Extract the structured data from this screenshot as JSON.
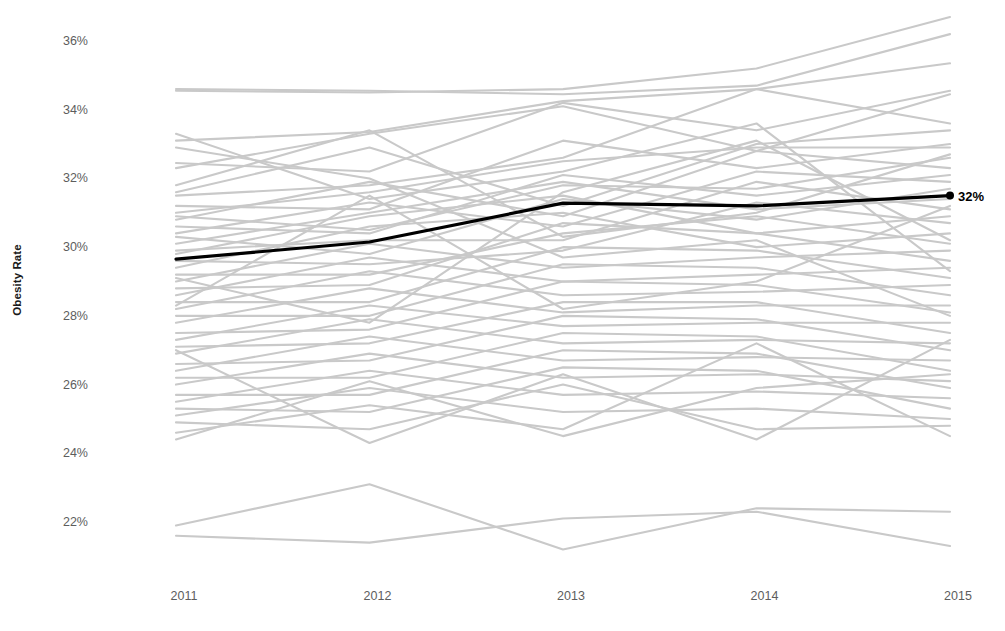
{
  "chart_data": {
    "type": "line",
    "title": "",
    "subtitle": "",
    "xlabel": "",
    "ylabel": "Obesity Rate",
    "x": [
      2011,
      2012,
      2013,
      2014,
      2015
    ],
    "xtick_labels": [
      "2011",
      "2012",
      "2013",
      "2014",
      "2015"
    ],
    "ytick_labels": [
      "36%",
      "34%",
      "32%",
      "30%",
      "28%",
      "26%",
      "24%",
      "22%"
    ],
    "ytick_values": [
      36,
      34,
      32,
      30,
      28,
      26,
      24,
      22
    ],
    "ylim": [
      21.2,
      37.0
    ],
    "xlim": [
      2011,
      2015
    ],
    "grid": false,
    "legend": "none",
    "axis_line": "none",
    "annotations": [
      {
        "text": "32%",
        "x": 2015,
        "y": 31.5,
        "marker": "dot",
        "color": "#000000"
      }
    ],
    "highlight_color": "#000000",
    "background_series_color": "#c9c9c9",
    "tick_label_color": "#5d5d5d",
    "highlight_series": {
      "name": "National Average",
      "color": "#000000",
      "width": 3.2,
      "values": [
        29.65,
        30.15,
        31.28,
        31.2,
        31.5
      ]
    },
    "series": [
      {
        "name": "s01",
        "values": [
          34.55,
          34.5,
          34.6,
          35.2,
          36.7
        ]
      },
      {
        "name": "s02",
        "values": [
          34.6,
          34.55,
          34.45,
          34.7,
          36.2
        ]
      },
      {
        "name": "s03",
        "values": [
          33.1,
          33.35,
          34.25,
          34.6,
          35.35
        ]
      },
      {
        "name": "s04",
        "values": [
          32.45,
          32.2,
          34.2,
          33.4,
          34.55
        ]
      },
      {
        "name": "s05",
        "values": [
          32.3,
          33.3,
          34.1,
          32.8,
          34.45
        ]
      },
      {
        "name": "s06",
        "values": [
          31.5,
          31.8,
          32.6,
          34.6,
          33.6
        ]
      },
      {
        "name": "s07",
        "values": [
          31.6,
          32.9,
          31.2,
          33.0,
          33.4
        ]
      },
      {
        "name": "s08",
        "values": [
          31.2,
          31.1,
          33.1,
          32.3,
          33.0
        ]
      },
      {
        "name": "s09",
        "values": [
          31.0,
          31.6,
          32.5,
          32.9,
          32.9
        ]
      },
      {
        "name": "s10",
        "values": [
          30.9,
          30.5,
          31.8,
          31.7,
          32.6
        ]
      },
      {
        "name": "s11",
        "values": [
          30.8,
          31.9,
          30.9,
          32.8,
          32.3
        ]
      },
      {
        "name": "s12",
        "values": [
          30.6,
          30.4,
          32.1,
          31.5,
          32.1
        ]
      },
      {
        "name": "s13",
        "values": [
          30.4,
          31.3,
          30.6,
          32.2,
          31.9
        ]
      },
      {
        "name": "s14",
        "values": [
          30.3,
          29.8,
          31.4,
          30.8,
          31.7
        ]
      },
      {
        "name": "s15",
        "values": [
          30.1,
          31.0,
          31.9,
          31.1,
          31.4
        ]
      },
      {
        "name": "s16",
        "values": [
          29.9,
          30.2,
          30.2,
          31.9,
          31.1
        ]
      },
      {
        "name": "s17",
        "values": [
          29.8,
          30.9,
          31.5,
          30.4,
          30.9
        ]
      },
      {
        "name": "s18",
        "values": [
          29.6,
          29.5,
          29.9,
          31.3,
          30.7
        ]
      },
      {
        "name": "s19",
        "values": [
          29.4,
          30.6,
          31.0,
          30.0,
          30.4
        ]
      },
      {
        "name": "s20",
        "values": [
          29.2,
          29.2,
          30.4,
          30.9,
          30.1
        ]
      },
      {
        "name": "s21",
        "values": [
          29.0,
          30.1,
          29.4,
          29.7,
          29.9
        ]
      },
      {
        "name": "s22",
        "values": [
          28.8,
          28.9,
          30.7,
          30.4,
          29.6
        ]
      },
      {
        "name": "s23",
        "values": [
          28.6,
          29.7,
          29.0,
          29.2,
          29.4
        ]
      },
      {
        "name": "s24",
        "values": [
          28.4,
          28.4,
          30.0,
          29.9,
          29.1
        ]
      },
      {
        "name": "s25",
        "values": [
          28.2,
          29.3,
          28.6,
          28.7,
          28.9
        ]
      },
      {
        "name": "s26",
        "values": [
          28.0,
          28.0,
          29.5,
          29.4,
          28.6
        ]
      },
      {
        "name": "s27",
        "values": [
          27.8,
          28.8,
          28.1,
          28.3,
          28.3
        ]
      },
      {
        "name": "s28",
        "values": [
          27.5,
          27.6,
          29.0,
          28.9,
          28.1
        ]
      },
      {
        "name": "s29",
        "values": [
          27.3,
          28.3,
          27.7,
          27.8,
          27.8
        ]
      },
      {
        "name": "s30",
        "values": [
          27.1,
          27.2,
          28.4,
          28.4,
          27.5
        ]
      },
      {
        "name": "s31",
        "values": [
          26.9,
          27.9,
          27.2,
          27.3,
          27.2
        ]
      },
      {
        "name": "s32",
        "values": [
          26.6,
          26.7,
          28.0,
          27.9,
          27.0
        ]
      },
      {
        "name": "s33",
        "values": [
          26.4,
          27.4,
          26.7,
          26.8,
          26.7
        ]
      },
      {
        "name": "s34",
        "values": [
          26.2,
          26.2,
          27.5,
          27.4,
          26.4
        ]
      },
      {
        "name": "s35",
        "values": [
          26.0,
          26.9,
          26.2,
          26.3,
          26.1
        ]
      },
      {
        "name": "s36",
        "values": [
          25.7,
          25.7,
          27.0,
          26.9,
          25.9
        ]
      },
      {
        "name": "s37",
        "values": [
          25.5,
          26.4,
          25.7,
          25.8,
          25.6
        ]
      },
      {
        "name": "s38",
        "values": [
          25.3,
          25.2,
          26.5,
          26.4,
          25.3
        ]
      },
      {
        "name": "s39",
        "values": [
          25.1,
          25.9,
          25.2,
          25.3,
          25.0
        ]
      },
      {
        "name": "s40",
        "values": [
          24.9,
          24.7,
          26.0,
          24.7,
          24.8
        ]
      },
      {
        "name": "s41",
        "values": [
          24.6,
          25.4,
          24.7,
          27.2,
          24.5
        ]
      },
      {
        "name": "s42",
        "values": [
          24.4,
          26.1,
          24.5,
          25.9,
          26.3
        ]
      },
      {
        "name": "s43",
        "values": [
          27.0,
          24.3,
          26.3,
          24.4,
          27.3
        ]
      },
      {
        "name": "s44",
        "values": [
          32.9,
          32.0,
          29.7,
          30.2,
          28.0
        ]
      },
      {
        "name": "s45",
        "values": [
          33.3,
          31.4,
          32.2,
          33.6,
          29.3
        ]
      },
      {
        "name": "s46",
        "values": [
          31.8,
          33.4,
          30.3,
          31.0,
          32.7
        ]
      },
      {
        "name": "s47",
        "values": [
          29.1,
          27.8,
          31.6,
          33.1,
          30.2
        ]
      },
      {
        "name": "s48",
        "values": [
          28.3,
          31.5,
          28.2,
          29.0,
          31.2
        ]
      },
      {
        "name": "s49",
        "values": [
          21.6,
          21.4,
          22.1,
          22.3,
          21.3
        ]
      },
      {
        "name": "s50",
        "values": [
          21.9,
          23.1,
          21.2,
          22.4,
          22.3
        ]
      }
    ]
  }
}
